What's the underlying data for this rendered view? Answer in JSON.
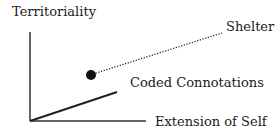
{
  "diagram": {
    "y_axis_label": "Territoriality",
    "x_axis_label": "Extension of Self",
    "labels": {
      "solid_line": "Coded Connotations",
      "dotted_line": "Shelter"
    },
    "colors": {
      "ink": "#1a1a1a",
      "background": "#ffffff"
    }
  }
}
